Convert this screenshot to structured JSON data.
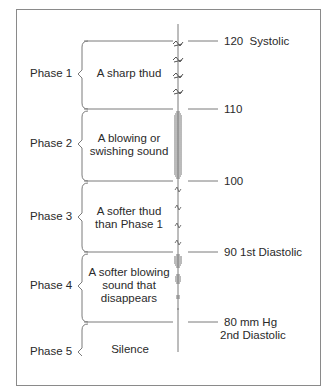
{
  "diagram": {
    "colors": {
      "line": "#7a7a7a",
      "text": "#2a2a2a",
      "frame": "#8a8a8a"
    },
    "phases": [
      {
        "label": "Phase 1",
        "description_lines": [
          "A sharp thud"
        ],
        "sound_type": "sharp-thud"
      },
      {
        "label": "Phase 2",
        "description_lines": [
          "A blowing or",
          "swishing sound"
        ],
        "sound_type": "dense-blowing"
      },
      {
        "label": "Phase 3",
        "description_lines": [
          "A softer thud",
          "than Phase 1"
        ],
        "sound_type": "soft-thud"
      },
      {
        "label": "Phase 4",
        "description_lines": [
          "A softer blowing",
          "sound that",
          "disappears"
        ],
        "sound_type": "fading-blowing"
      },
      {
        "label": "Phase 5",
        "description_lines": [
          "Silence"
        ],
        "sound_type": "silence"
      }
    ],
    "pressure_marks": [
      {
        "value": "120",
        "label": "Systolic"
      },
      {
        "value": "110",
        "label": ""
      },
      {
        "value": "100",
        "label": ""
      },
      {
        "value": "90",
        "label": "1st Diastolic"
      },
      {
        "value": "80 mm Hg",
        "label": "2nd Diastolic"
      }
    ]
  }
}
